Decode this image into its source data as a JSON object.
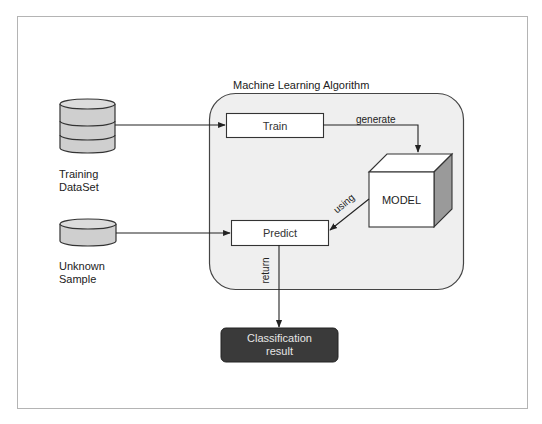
{
  "diagram": {
    "title": "Machine Learning Algorithm",
    "colors": {
      "frame_border": "#b4b4b4",
      "container_fill": "#efefef",
      "container_border": "#444444",
      "cylinder_fill": "#cfcfcf",
      "cube_side": "#9a9a9a",
      "result_fill": "#3a3a3a",
      "result_text": "#e6e6e6"
    },
    "nodes": {
      "training_dataset": {
        "label_line1": "Training",
        "label_line2": "DataSet",
        "shape": "cylinder-stack"
      },
      "unknown_sample": {
        "label_line1": "Unknown",
        "label_line2": "Sample",
        "shape": "cylinder"
      },
      "train": {
        "label": "Train",
        "shape": "rectangle"
      },
      "predict": {
        "label": "Predict",
        "shape": "rectangle"
      },
      "model": {
        "label": "MODEL",
        "shape": "cube"
      },
      "result": {
        "label_line1": "Classification",
        "label_line2": "result",
        "shape": "rounded-rectangle"
      }
    },
    "edges": [
      {
        "from": "training_dataset",
        "to": "train",
        "label": ""
      },
      {
        "from": "train",
        "to": "model",
        "label": "generate"
      },
      {
        "from": "model",
        "to": "predict",
        "label": "using"
      },
      {
        "from": "unknown_sample",
        "to": "predict",
        "label": ""
      },
      {
        "from": "predict",
        "to": "result",
        "label": "return"
      }
    ]
  }
}
